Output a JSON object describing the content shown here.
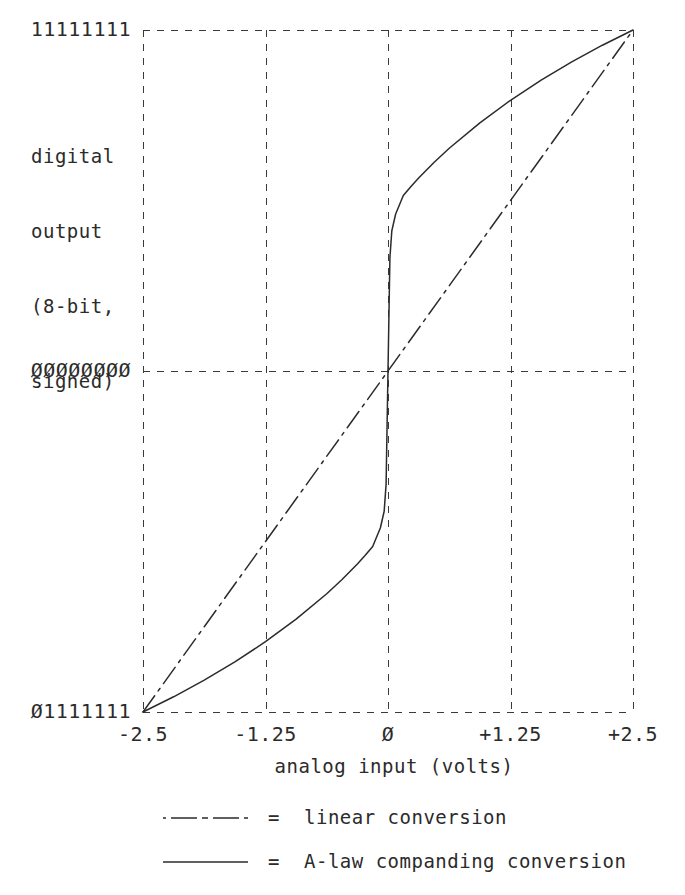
{
  "chart_data": {
    "type": "line",
    "title": "",
    "xlabel": "analog input (volts)",
    "ylabel": "digital output (8-bit, signed)",
    "ylabel_lines": [
      "digital",
      "output",
      "(8-bit,",
      "signed)"
    ],
    "xlim": [
      -2.5,
      2.5
    ],
    "xticks": [
      -2.5,
      -1.25,
      0,
      1.25,
      2.5
    ],
    "xticklabels": [
      "-2.5",
      "-1.25",
      "Ø",
      "+1.25",
      "+2.5"
    ],
    "yticks": [
      -128,
      0,
      127
    ],
    "yticklabels": [
      "11111111",
      "ØØØØØØØØ",
      "Ø1111111"
    ],
    "grid": true,
    "grid_style": "dashed",
    "legend_position": "below-axes",
    "series": [
      {
        "name": "linear conversion",
        "style": "dash-dot",
        "x": [
          -2.5,
          2.5
        ],
        "y": [
          -1.0,
          1.0
        ]
      },
      {
        "name": "A-law companding conversion",
        "style": "solid",
        "x": [
          -2.5,
          -2.1875,
          -1.875,
          -1.5625,
          -1.25,
          -0.9375,
          -0.625,
          -0.46875,
          -0.3125,
          -0.234375,
          -0.15625,
          -0.078125,
          -0.0390625,
          -0.01953125,
          0,
          0.01953125,
          0.0390625,
          0.078125,
          0.15625,
          0.234375,
          0.3125,
          0.46875,
          0.625,
          0.9375,
          1.25,
          1.5625,
          1.875,
          2.1875,
          2.5
        ],
        "y": [
          -1.0,
          -0.9554,
          -0.9067,
          -0.8531,
          -0.7939,
          -0.7278,
          -0.6531,
          -0.6113,
          -0.5658,
          -0.5412,
          -0.5145,
          -0.4604,
          -0.4112,
          -0.3325,
          0,
          0.3325,
          0.4112,
          0.4604,
          0.5145,
          0.5412,
          0.5658,
          0.6113,
          0.6531,
          0.7278,
          0.7939,
          0.8531,
          0.9067,
          0.9554,
          1.0
        ]
      }
    ]
  },
  "legend": {
    "equals": "=",
    "entries": [
      {
        "label": "linear conversion",
        "style": "dash-dot"
      },
      {
        "label": "A-law companding conversion",
        "style": "solid"
      }
    ]
  },
  "colors": {
    "ink": "#2b2b2b",
    "grid": "#3a3a3a",
    "background": "#ffffff"
  }
}
